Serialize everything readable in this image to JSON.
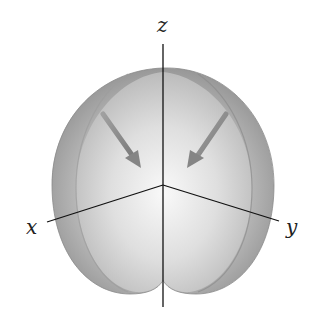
{
  "diagram": {
    "type": "3d-surface-plot",
    "axes": {
      "x": {
        "label": "x"
      },
      "y": {
        "label": "y"
      },
      "z": {
        "label": "z"
      }
    },
    "arrows": [
      {
        "name": "left-arrow",
        "direction": "down-right toward center"
      },
      {
        "name": "right-arrow",
        "direction": "down-left toward center"
      }
    ],
    "colors": {
      "background": "#ffffff",
      "surface_outer": "#9a9a9a",
      "surface_inner": "#d8d8d8",
      "highlight": "#f4f4f4",
      "axis": "#111111",
      "arrow": "#8a8a8a"
    }
  }
}
